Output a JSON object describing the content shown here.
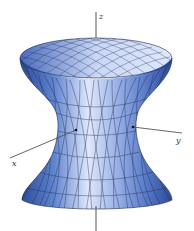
{
  "figure": {
    "axes": {
      "z_label": "z",
      "y_label": "y",
      "x_label": "x"
    },
    "colors": {
      "background": "#ffffff",
      "surface_dark": "#2f4f9e",
      "surface_mid": "#6d8fd6",
      "surface_light": "#dfe8fb",
      "mesh_line": "#1e2a4a",
      "axis": "#555555"
    }
  }
}
